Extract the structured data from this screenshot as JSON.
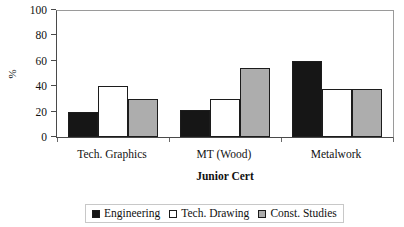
{
  "chart_data": {
    "type": "bar",
    "title": "",
    "xlabel": "Junior Cert",
    "ylabel": "%",
    "categories": [
      "Tech. Graphics",
      "MT (Wood)",
      "Metalwork"
    ],
    "series": [
      {
        "name": "Engineering",
        "color": "#161616",
        "values": [
          20,
          21,
          60
        ]
      },
      {
        "name": "Tech. Drawing",
        "color": "#ffffff",
        "values": [
          40,
          30,
          38
        ]
      },
      {
        "name": "Const. Studies",
        "color": "#adadad",
        "values": [
          30,
          54,
          38
        ]
      }
    ],
    "ylim": [
      0,
      100
    ],
    "ytick_labels": [
      "0",
      "20",
      "40",
      "60",
      "80",
      "100"
    ],
    "ytick_values": [
      0,
      20,
      40,
      60,
      80,
      100
    ],
    "grid": false,
    "legend_position": "bottom"
  }
}
